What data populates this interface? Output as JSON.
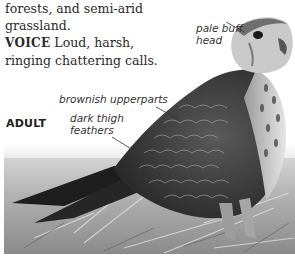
{
  "text": {
    "line1": "forests, and semi-arid",
    "line2": "grassland.",
    "voice_label": "VOICE",
    "voice_text": " Loud, harsh,",
    "voice_text2": "ringing chattering calls."
  },
  "figure": {
    "age_label": "ADULT",
    "annotations": [
      {
        "label": "pale buff head"
      },
      {
        "label": "brownish upperparts"
      },
      {
        "label": "dark thigh feathers"
      }
    ],
    "annotation_lines": {
      "head_1": "pale buff",
      "head_2": "head",
      "upperparts": "brownish upperparts",
      "thigh_1": "dark thigh",
      "thigh_2": "feathers"
    }
  }
}
